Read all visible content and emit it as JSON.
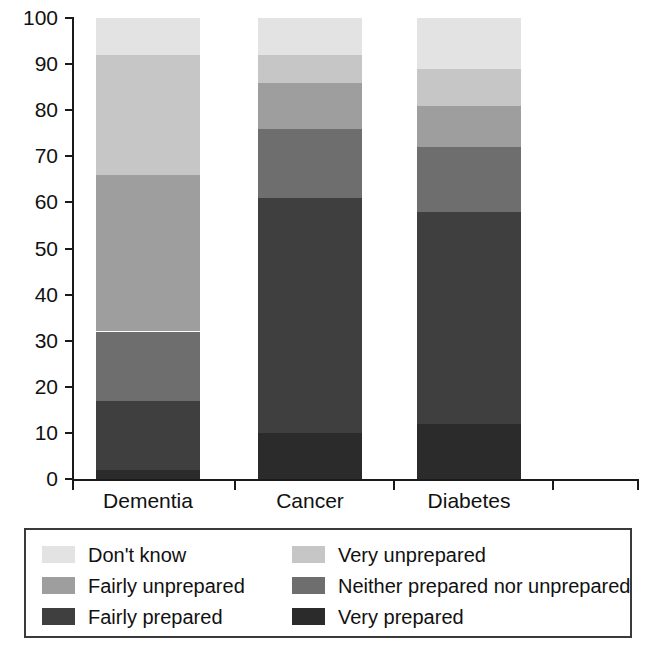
{
  "chart_data": {
    "type": "bar",
    "subtype": "stacked-bar-100-percent",
    "title": "",
    "xlabel": "",
    "ylabel": "",
    "ylim": [
      0,
      100
    ],
    "ytick_labels": [
      "0",
      "10",
      "20",
      "30",
      "40",
      "50",
      "60",
      "70",
      "80",
      "90",
      "100"
    ],
    "ytick_values": [
      0,
      10,
      20,
      30,
      40,
      50,
      60,
      70,
      80,
      90,
      100
    ],
    "grid": false,
    "legend_position": "bottom",
    "categories": [
      "Dementia",
      "Cancer",
      "Diabetes"
    ],
    "series": [
      {
        "name": "Very prepared",
        "color": "#2b2b2b",
        "values": [
          2,
          10,
          12
        ]
      },
      {
        "name": "Fairly prepared",
        "color": "#3f3f3f",
        "values": [
          15,
          51,
          46
        ]
      },
      {
        "name": "Neither prepared nor unprepared",
        "color": "#6e6e6e",
        "values": [
          15,
          15,
          14
        ]
      },
      {
        "name": "Fairly unprepared",
        "color": "#9e9e9e",
        "values": [
          34,
          10,
          9
        ]
      },
      {
        "name": "Very unprepared",
        "color": "#c6c6c6",
        "values": [
          26,
          6,
          8
        ]
      },
      {
        "name": "Don't know",
        "color": "#e3e3e3",
        "values": [
          8,
          8,
          11
        ]
      }
    ],
    "cumulative_tops": {
      "Dementia": [
        2,
        17,
        32,
        66,
        92,
        100
      ],
      "Cancer": [
        10,
        61,
        76,
        86,
        92,
        100
      ],
      "Diabetes": [
        12,
        58,
        72,
        81,
        89,
        100
      ]
    }
  },
  "legend": {
    "entries": [
      {
        "label": "Don't know",
        "color": "#e3e3e3"
      },
      {
        "label": "Very unprepared",
        "color": "#c6c6c6"
      },
      {
        "label": "Fairly unprepared",
        "color": "#9e9e9e"
      },
      {
        "label": "Neither prepared nor unprepared",
        "color": "#6e6e6e"
      },
      {
        "label": "Fairly prepared",
        "color": "#3f3f3f"
      },
      {
        "label": "Very prepared",
        "color": "#2b2b2b"
      }
    ]
  }
}
